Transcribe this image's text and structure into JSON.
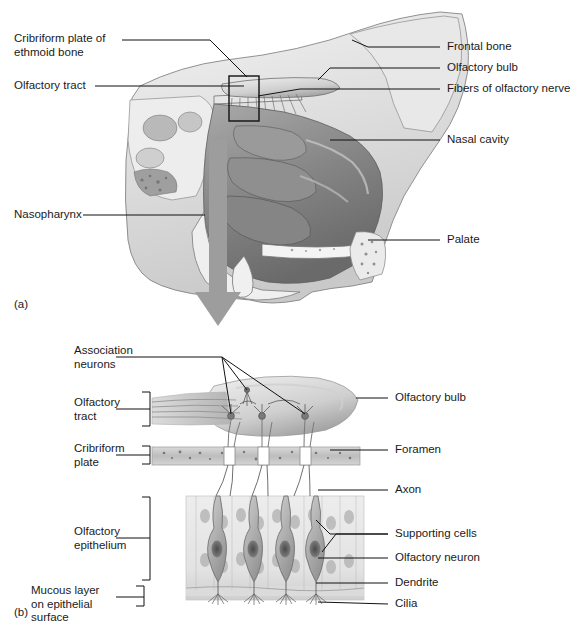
{
  "figure": {
    "type": "anatomical-illustration",
    "style": "grayscale medical illustration with leader-line labels",
    "panels": [
      {
        "mark": "(a)",
        "name": "sagittal-section-of-nasal-cavity",
        "labels_left": [
          {
            "text": "Cribriform plate of\nethmoid bone",
            "name": "label-cribriform-plate-of-ethmoid-bone"
          },
          {
            "text": "Olfactory tract",
            "name": "label-olfactory-tract"
          },
          {
            "text": "Nasopharynx",
            "name": "label-nasopharynx"
          }
        ],
        "labels_right": [
          {
            "text": "Frontal bone",
            "name": "label-frontal-bone"
          },
          {
            "text": "Olfactory bulb",
            "name": "label-olfactory-bulb"
          },
          {
            "text": "Fibers of olfactory nerve",
            "name": "label-fibers-of-olfactory-nerve"
          },
          {
            "text": "Nasal cavity",
            "name": "label-nasal-cavity"
          },
          {
            "text": "Palate",
            "name": "label-palate"
          }
        ],
        "callout_box": "rectangle outlining cribriform plate region",
        "zoom_arrow": "large gray downward arrow linking panel a to panel b"
      },
      {
        "mark": "(b)",
        "name": "olfactory-epithelium-detail",
        "labels_left": [
          {
            "text": "Association\nneurons",
            "name": "label-association-neurons"
          },
          {
            "text": "Olfactory\ntract",
            "name": "label-olfactory-tract-b"
          },
          {
            "text": "Cribriform\nplate",
            "name": "label-cribriform-plate-b"
          },
          {
            "text": "Olfactory\nepithelium",
            "name": "label-olfactory-epithelium"
          },
          {
            "text": "Mucous layer\non epithelial\nsurface",
            "name": "label-mucous-layer-on-epithelial-surface"
          }
        ],
        "labels_right": [
          {
            "text": "Olfactory bulb",
            "name": "label-olfactory-bulb-b"
          },
          {
            "text": "Foramen",
            "name": "label-foramen"
          },
          {
            "text": "Axon",
            "name": "label-axon"
          },
          {
            "text": "Supporting cells",
            "name": "label-supporting-cells"
          },
          {
            "text": "Olfactory neuron",
            "name": "label-olfactory-neuron"
          },
          {
            "text": "Dendrite",
            "name": "label-dendrite"
          },
          {
            "text": "Cilia",
            "name": "label-cilia"
          }
        ]
      }
    ],
    "colors": {
      "ink": "#111111",
      "tissue_mid": "#8d8d8d",
      "tissue_dark": "#5d5d5d",
      "tissue_light": "#d6d6d6",
      "arrow": "#9a9a9a",
      "background": "#ffffff"
    }
  }
}
